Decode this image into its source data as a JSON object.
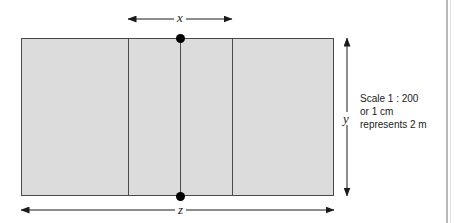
{
  "figure": {
    "type": "scale-plan-diagram",
    "labels": {
      "x": "x",
      "y": "y",
      "z": "z"
    },
    "scale_note": {
      "line1": "Scale 1 : 200",
      "line2": "or 1 cm",
      "line3": "represents 2 m"
    },
    "colors": {
      "fill": "#dcdcdc",
      "stroke": "#4a4a4a",
      "ink": "#1a1a1a",
      "page_edge": "#b9b9b9"
    },
    "geometry": {
      "rect": {
        "left": 21,
        "top": 38,
        "width": 313,
        "height": 158
      },
      "dividers_x": [
        128,
        180,
        232
      ],
      "nodes": [
        {
          "x": 180,
          "y": 38
        },
        {
          "x": 180,
          "y": 196
        }
      ],
      "x_dimension": {
        "from": 128,
        "to": 232,
        "y": 19
      },
      "y_dimension": {
        "x": 347,
        "from": 38,
        "to": 196
      },
      "z_dimension": {
        "from": 21,
        "to": 334,
        "y": 210
      }
    }
  }
}
